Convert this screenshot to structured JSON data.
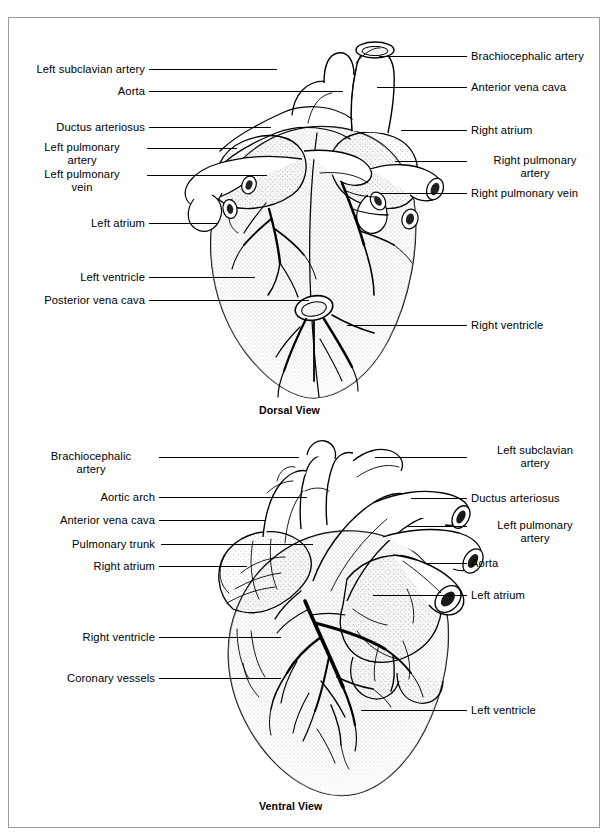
{
  "figure": {
    "type": "anatomical-diagram",
    "border_color": "#9a9a9a",
    "ink_color": "#000000",
    "background": "#ffffff"
  },
  "panels": [
    {
      "id": "dorsal",
      "caption": "Dorsal View",
      "left_labels": [
        {
          "text": "Left subclavian artery",
          "y": 52
        },
        {
          "text": "Aorta",
          "y": 74
        },
        {
          "text": "Ductus arteriosus",
          "y": 110
        },
        {
          "text": "Left pulmonary\nartery",
          "y": 130
        },
        {
          "text": "Left pulmonary\nvein",
          "y": 157
        },
        {
          "text": "Left atrium",
          "y": 206
        },
        {
          "text": "Left ventricle",
          "y": 260
        },
        {
          "text": "Posterior vena cava",
          "y": 283
        }
      ],
      "right_labels": [
        {
          "text": "Brachiocephalic artery",
          "y": 39
        },
        {
          "text": "Anterior vena cava",
          "y": 70
        },
        {
          "text": "Right atrium",
          "y": 113
        },
        {
          "text": "Right pulmonary\nartery",
          "y": 143
        },
        {
          "text": "Right pulmonary vein",
          "y": 176
        },
        {
          "text": "Right ventricle",
          "y": 308
        }
      ]
    },
    {
      "id": "ventral",
      "caption": "Ventral View",
      "left_labels": [
        {
          "text": "Brachiocephalic\nartery",
          "y": 446
        },
        {
          "text": "Aortic arch",
          "y": 480
        },
        {
          "text": "Anterior vena cava",
          "y": 503
        },
        {
          "text": "Pulmonary trunk",
          "y": 527
        },
        {
          "text": "Right atrium",
          "y": 549
        },
        {
          "text": "Right ventricle",
          "y": 620
        },
        {
          "text": "Coronary vessels",
          "y": 661
        }
      ],
      "right_labels": [
        {
          "text": "Left subclavian\nartery",
          "y": 440
        },
        {
          "text": "Ductus arteriosus",
          "y": 481
        },
        {
          "text": "Left pulmonary\nartery",
          "y": 508
        },
        {
          "text": "Aorta",
          "y": 546
        },
        {
          "text": "Left atrium",
          "y": 578
        },
        {
          "text": "Left ventricle",
          "y": 693
        }
      ]
    }
  ]
}
